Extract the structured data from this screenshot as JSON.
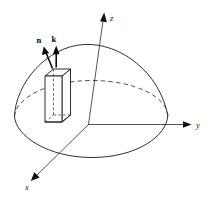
{
  "figure": {
    "background_color": "#ffffff",
    "line_color": "#1a1a1a",
    "width": 210,
    "height": 199
  },
  "axes": {
    "z": {
      "label": "z",
      "label_x": 110,
      "label_y": 21,
      "arrow_from": [
        88,
        124
      ],
      "arrow_to": [
        104,
        13
      ]
    },
    "y": {
      "label": "y",
      "label_x": 196,
      "label_y": 127,
      "arrow_from": [
        88,
        124
      ],
      "arrow_to": [
        191,
        124
      ]
    },
    "x": {
      "label": "x",
      "label_x": 26,
      "label_y": 189,
      "arrow_from": [
        88,
        124
      ],
      "arrow_to": [
        31,
        180
      ]
    }
  },
  "vectors": [
    {
      "name": "n",
      "label": "n",
      "label_x": 37,
      "label_y": 42,
      "from": [
        52,
        68
      ],
      "to": [
        44,
        48
      ]
    },
    {
      "name": "k",
      "label": "k",
      "label_x": 53,
      "label_y": 41,
      "from": [
        56,
        67
      ],
      "to": [
        56,
        47
      ]
    }
  ],
  "hemisphere": {
    "apex": [
      105,
      45
    ],
    "base_center": [
      91,
      118
    ],
    "base_rx": 77,
    "base_ry": 38,
    "front_arc_style": "solid",
    "back_arc_style": "dashed"
  },
  "slab": {
    "description": "rectangular prism element on the surface",
    "top_front_left": [
      45,
      76
    ],
    "width": 17,
    "height": 52,
    "depth": 9
  }
}
